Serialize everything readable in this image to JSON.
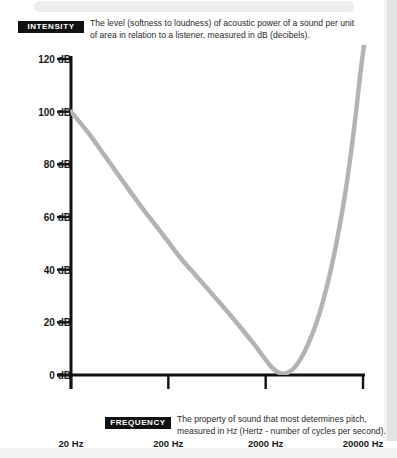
{
  "callouts": {
    "intensity": {
      "badge": "INTENSITY",
      "description": "The level (softness to loudness) of acoustic power of a sound per unit of area in relation to a listener, measured in dB (decibels)."
    },
    "frequency": {
      "badge": "FREQUENCY",
      "description": "The property of sound that most determines pitch, measured in Hz (Hertz - number of cycles per second)."
    }
  },
  "chart_data": {
    "type": "line",
    "title": "",
    "xlabel": "FREQUENCY",
    "ylabel": "INTENSITY",
    "xlabel_unit": "Hz",
    "ylabel_unit": "dB",
    "xscale": "log",
    "xlim": [
      20,
      20000
    ],
    "ylim": [
      0,
      120
    ],
    "grid": false,
    "legend": null,
    "x_ticks": [
      20,
      200,
      2000,
      20000
    ],
    "x_tick_labels": [
      "20 Hz",
      "200 Hz",
      "2000 Hz",
      "20000 Hz"
    ],
    "y_ticks": [
      0,
      20,
      40,
      60,
      80,
      100,
      120
    ],
    "y_tick_labels": [
      "0 dB",
      "20 dB",
      "40 dB",
      "60 dB",
      "80 dB",
      "100 dB",
      "120 dB"
    ],
    "series": [
      {
        "name": "threshold of hearing",
        "color": "#b3b3b3",
        "x": [
          20,
          30,
          45,
          70,
          110,
          170,
          260,
          400,
          620,
          950,
          1500,
          2300,
          3000,
          4000,
          5500,
          7500,
          10000,
          13000,
          16000,
          19000,
          21000
        ],
        "y": [
          100,
          92,
          83,
          73,
          63,
          54,
          45,
          37,
          29,
          21,
          12,
          3,
          0.5,
          3,
          12,
          26,
          45,
          68,
          92,
          116,
          128
        ]
      }
    ]
  }
}
